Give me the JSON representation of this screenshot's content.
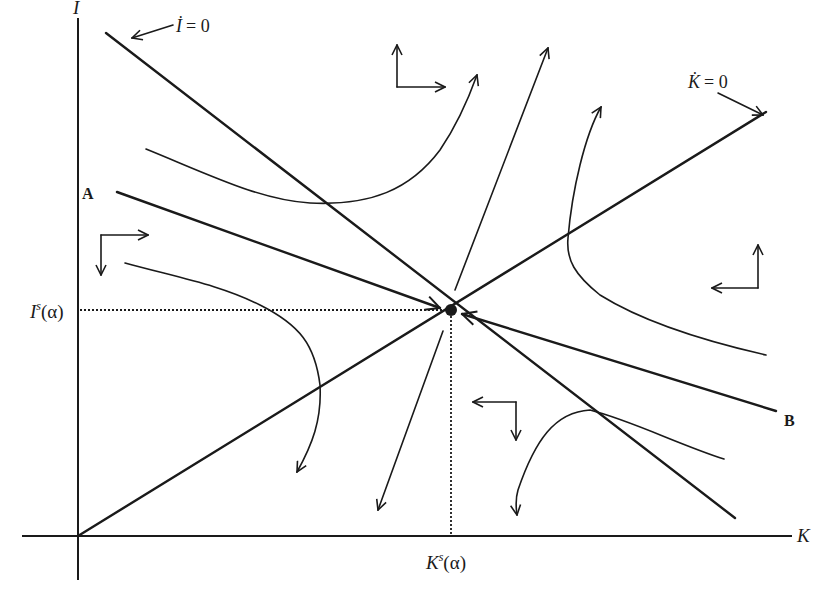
{
  "axes": {
    "y_label": "I",
    "x_label": "K"
  },
  "loci": {
    "i_dot_zero": {
      "var": "İ",
      "eq": "= 0"
    },
    "k_dot_zero": {
      "var": "K̇",
      "eq": "= 0"
    }
  },
  "steady_state": {
    "i_label_main": "I",
    "i_label_sup": "s",
    "k_label_main": "K",
    "k_label_sup": "s",
    "arg": "(α)"
  },
  "saddle_path": {
    "start_label": "A",
    "end_label": "B"
  },
  "colors": {
    "ink": "#1a1a1a",
    "background": "#ffffff"
  }
}
